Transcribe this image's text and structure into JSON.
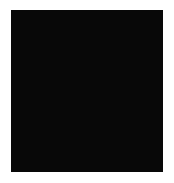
{
  "figure": {
    "kind": "grayscale-noise-texture",
    "canvas": {
      "width": 174,
      "height": 183,
      "background": "#ffffff"
    },
    "image": {
      "x": 11,
      "y": 10,
      "width": 152,
      "height": 162,
      "colorspace": "grayscale",
      "min_gray": 8,
      "max_gray": 250,
      "mean_gray": 132,
      "border": "none",
      "alt_text": ""
    },
    "texture": {
      "type": "fractal-value-noise",
      "base_cell_px": 13,
      "octaves": 4,
      "lacunarity": 2.0,
      "persistence": 0.52,
      "seed": 20240517,
      "contrast": 1.55,
      "smoothing_px": 0.9
    }
  },
  "chart_data": {
    "type": "heatmap",
    "title": "",
    "subtitle": "",
    "xlabel": "",
    "ylabel": "",
    "legend": [],
    "annotations": [],
    "grid": false,
    "colormap": "gray",
    "vmin": 0,
    "vmax": 255,
    "xlim": [
      0,
      152
    ],
    "ylim": [
      0,
      162
    ],
    "x_tick_labels": [],
    "y_tick_labels": []
  }
}
